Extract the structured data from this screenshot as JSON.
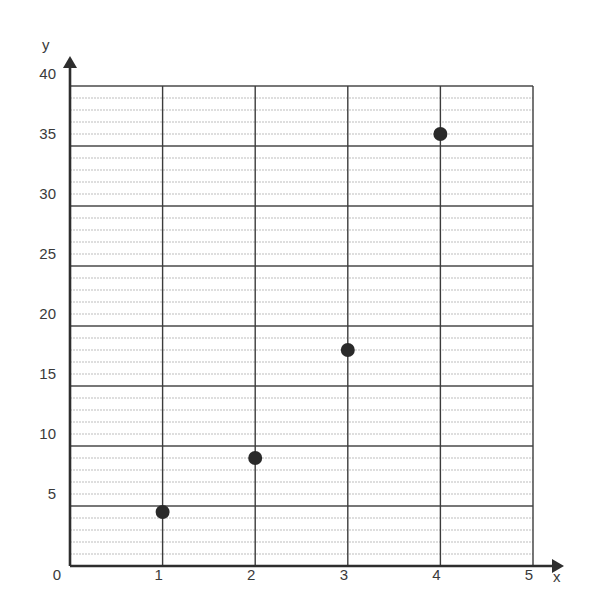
{
  "chart_data": {
    "type": "scatter",
    "title": "",
    "xlabel": "x",
    "ylabel": "y",
    "xlim": [
      0,
      5
    ],
    "ylim": [
      0,
      40
    ],
    "x_ticks": [
      0,
      1,
      2,
      3,
      4,
      5
    ],
    "y_ticks": [
      0,
      5,
      10,
      15,
      20,
      25,
      30,
      35,
      40
    ],
    "x_tick_labels": [
      "0",
      "1",
      "2",
      "3",
      "4",
      "5"
    ],
    "y_tick_labels": [
      "5",
      "10",
      "15",
      "20",
      "25",
      "30",
      "35",
      "40"
    ],
    "grid": {
      "major_x_step": 1,
      "major_y_step": 5,
      "minor_y_step": 1
    },
    "legend": null,
    "series": [
      {
        "name": "points",
        "x": [
          1,
          2,
          3,
          4
        ],
        "y": [
          4.5,
          9,
          18,
          36
        ]
      }
    ]
  },
  "colors": {
    "point": "#2a2a2a",
    "axis": "#2e2e2e",
    "major_grid": "#4a4a4a",
    "minor_grid": "#bdbdbd"
  }
}
